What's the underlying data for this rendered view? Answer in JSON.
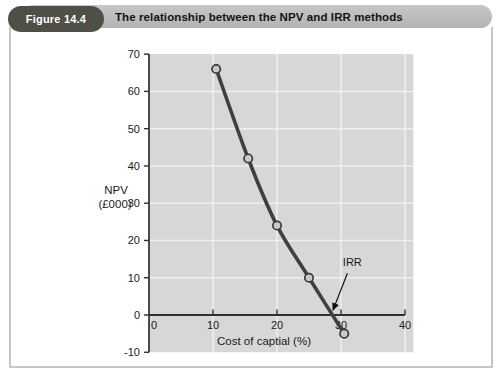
{
  "figure": {
    "label": "Figure 14.4",
    "title": "The relationship between the NPV and IRR methods"
  },
  "colors": {
    "pill_bg": "#4f4e47",
    "pill_text": "#ffffff",
    "bar_bg": "#bcbcbc",
    "box_border": "#c6c6c6",
    "plot_bg": "#d7d7d7",
    "grid": "#efefef",
    "axis": "#2f2f2f",
    "curve": "#3f3f3f",
    "marker_fill": "#c9c9c9",
    "marker_stroke": "#3a3a3a",
    "text": "#1a1a1a",
    "annotation": "#111111"
  },
  "chart_data": {
    "type": "line",
    "title": "",
    "xlabel": "Cost of captial (%)",
    "ylabel_line1": "NPV",
    "ylabel_line2": "(£000)",
    "xlim": [
      0,
      40
    ],
    "ylim": [
      -10,
      70
    ],
    "x_ticks": [
      0,
      10,
      20,
      30,
      40
    ],
    "y_ticks": [
      70,
      60,
      50,
      40,
      30,
      20,
      10,
      0,
      -10
    ],
    "grid": true,
    "legend": false,
    "points": [
      {
        "x": 10.5,
        "y": 66
      },
      {
        "x": 15.5,
        "y": 42
      },
      {
        "x": 20,
        "y": 24
      },
      {
        "x": 25,
        "y": 10
      },
      {
        "x": 30.5,
        "y": -5
      }
    ],
    "annotation": {
      "label": "IRR",
      "irr_value_percent": 28.5,
      "label_x": 30.6,
      "label_y": 13.2,
      "arrow_from": {
        "x": 31.0,
        "y": 11.2
      },
      "arrow_to": {
        "x": 28.75,
        "y": 1.3
      }
    }
  }
}
